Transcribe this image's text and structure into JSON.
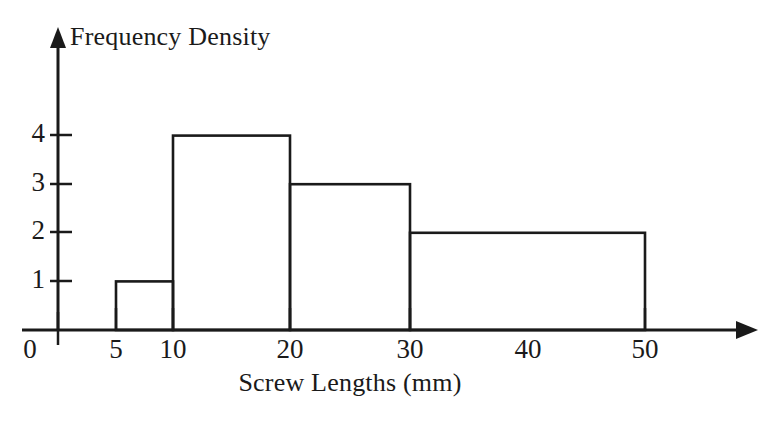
{
  "chart_data": {
    "type": "bar",
    "title": "",
    "subtitle": "",
    "xlabel": "Screw Lengths (mm)",
    "ylabel": "Frequency Density",
    "xlim": [
      0,
      58
    ],
    "ylim": [
      0,
      5.2
    ],
    "grid": false,
    "legend": "none",
    "style": "hand-drawn histogram, unfilled bars, black outline on white",
    "x_tick_labels": [
      "0",
      "5",
      "10",
      "20",
      "30",
      "40",
      "50"
    ],
    "x_tick_values": [
      0,
      5,
      10,
      20,
      30,
      40,
      50
    ],
    "x_ticks_with_marks": [
      0,
      5,
      10,
      20,
      30,
      50
    ],
    "y_tick_labels": [
      "1",
      "2",
      "3",
      "4"
    ],
    "y_tick_values": [
      1,
      2,
      3,
      4
    ],
    "bars": [
      {
        "label": "5-10",
        "bin_start": 5,
        "bin_end": 10,
        "width": 5,
        "value": 1,
        "frequency": 5
      },
      {
        "label": "10-20",
        "bin_start": 10,
        "bin_end": 20,
        "width": 10,
        "value": 4,
        "frequency": 40
      },
      {
        "label": "20-30",
        "bin_start": 20,
        "bin_end": 30,
        "width": 10,
        "value": 3,
        "frequency": 30
      },
      {
        "label": "30-50",
        "bin_start": 30,
        "bin_end": 50,
        "width": 20,
        "value": 2,
        "frequency": 40
      }
    ],
    "categories": [
      "5-10",
      "10-20",
      "20-30",
      "30-50"
    ],
    "values": [
      1,
      4,
      3,
      2
    ],
    "colors": {
      "axis": "#1a1a1a",
      "bar_stroke": "#1a1a1a",
      "bar_fill": "none",
      "background": "#ffffff",
      "text": "#1a1a1a"
    }
  },
  "axes": {
    "y_title": "Frequency Density",
    "x_title": "Screw Lengths (mm)",
    "y_ticks": [
      {
        "label": "1"
      },
      {
        "label": "2"
      },
      {
        "label": "3"
      },
      {
        "label": "4"
      }
    ],
    "x_ticks": [
      {
        "label": "0"
      },
      {
        "label": "5"
      },
      {
        "label": "10"
      },
      {
        "label": "20"
      },
      {
        "label": "30"
      },
      {
        "label": "40"
      },
      {
        "label": "50"
      }
    ]
  }
}
